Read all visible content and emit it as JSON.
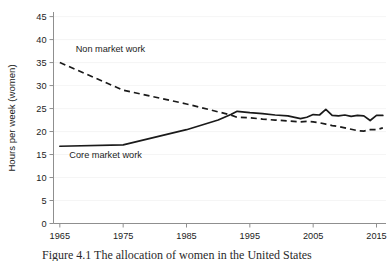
{
  "figure": {
    "caption": "Figure 4.1 The allocation of women in the United States",
    "background_color": "#ffffff",
    "line_color": "#1a1a1a",
    "axis_color": "#8f8f8f"
  },
  "chart_data": {
    "type": "line",
    "title": "",
    "xlabel": "",
    "ylabel": "Hours per week (women)",
    "xlim": [
      1964,
      2016.5
    ],
    "ylim": [
      0,
      46
    ],
    "xticks": [
      1965,
      1975,
      1985,
      1995,
      2005,
      2015
    ],
    "xticklabels": [
      "1965",
      "1975",
      "1985",
      "1995",
      "2005",
      "2015"
    ],
    "yticks": [
      0,
      5,
      10,
      15,
      20,
      25,
      30,
      35,
      40,
      45
    ],
    "yticklabels": [
      "0",
      "5",
      "10",
      "15",
      "20",
      "25",
      "30",
      "35",
      "40",
      "45"
    ],
    "grid": false,
    "legend_position": "inline-annotation",
    "annotations": [
      {
        "text": "Non market work",
        "x": 1967.5,
        "y": 37.3
      },
      {
        "text": "Core market work",
        "x": 1966.5,
        "y": 14.2
      }
    ],
    "series": [
      {
        "name": "Non market work",
        "style": "dashed",
        "x": [
          1965,
          1975,
          1985,
          1992,
          1993,
          1995,
          1997,
          1999,
          2001,
          2003,
          2004,
          2005,
          2006,
          2007,
          2008,
          2009,
          2010,
          2011,
          2012,
          2013,
          2014,
          2015,
          2016
        ],
        "y": [
          35.0,
          29.0,
          26.0,
          23.6,
          23.1,
          23.0,
          22.7,
          22.5,
          22.3,
          22.1,
          22.2,
          22.1,
          21.9,
          21.6,
          21.3,
          21.1,
          20.8,
          20.5,
          20.2,
          20.1,
          20.4,
          20.4,
          20.8
        ]
      },
      {
        "name": "Core market work",
        "style": "solid",
        "x": [
          1965,
          1975,
          1985,
          1990,
          1992,
          1993,
          1995,
          1997,
          1999,
          2001,
          2003,
          2004,
          2005,
          2006,
          2007,
          2008,
          2009,
          2010,
          2011,
          2012,
          2013,
          2014,
          2015,
          2016
        ],
        "y": [
          16.8,
          17.1,
          20.4,
          22.5,
          23.7,
          24.4,
          24.1,
          23.9,
          23.6,
          23.4,
          22.8,
          23.1,
          23.7,
          23.6,
          24.8,
          23.5,
          23.4,
          23.6,
          23.3,
          23.5,
          23.4,
          22.4,
          23.5,
          23.5
        ]
      }
    ]
  }
}
